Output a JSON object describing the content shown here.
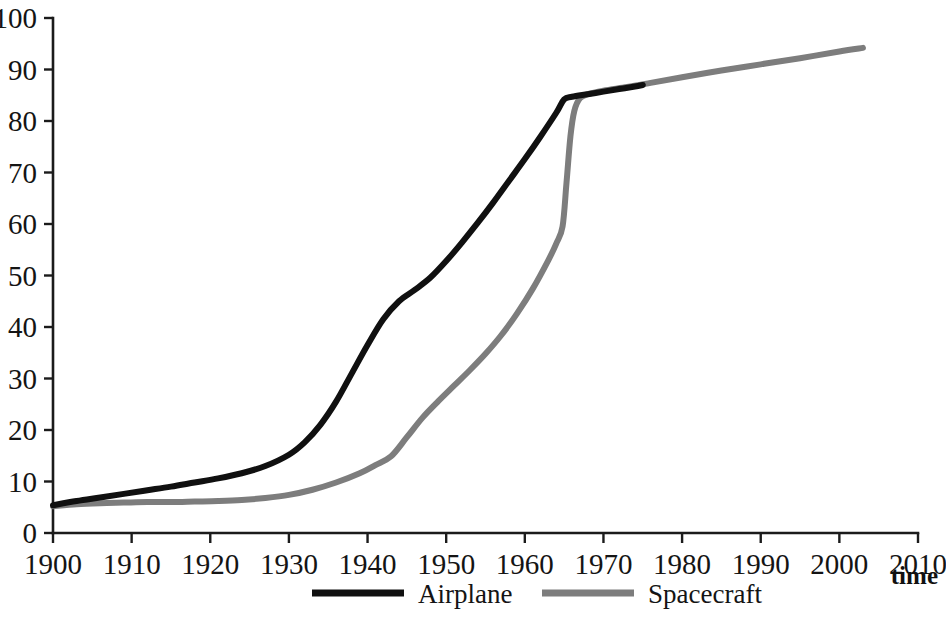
{
  "chart_data": {
    "type": "line",
    "title": "",
    "subtitle": "",
    "xlabel": "time",
    "ylabel": "",
    "xlim": [
      1900,
      2010
    ],
    "ylim": [
      0,
      100
    ],
    "grid": false,
    "legend_position": "bottom-center",
    "x_ticks": [
      1900,
      1910,
      1920,
      1930,
      1940,
      1950,
      1960,
      1970,
      1980,
      1990,
      2000,
      2010
    ],
    "y_ticks": [
      0,
      10,
      20,
      30,
      40,
      50,
      60,
      70,
      80,
      90,
      100
    ],
    "series": [
      {
        "name": "Airplane",
        "color": "#101010",
        "stroke_width": 6,
        "x": [
          1900,
          1903,
          1906,
          1909,
          1912,
          1915,
          1918,
          1921,
          1924,
          1927,
          1930,
          1932,
          1934,
          1936,
          1938,
          1940,
          1942,
          1944,
          1946,
          1948,
          1950,
          1952,
          1954,
          1956,
          1958,
          1960,
          1962,
          1964,
          1965,
          1966,
          1968,
          1970,
          1972,
          1974,
          1975
        ],
        "values": [
          5.4,
          6.2,
          6.9,
          7.6,
          8.3,
          9.0,
          9.8,
          10.6,
          11.6,
          13.0,
          15.2,
          17.6,
          21.0,
          25.5,
          31.0,
          36.5,
          41.5,
          45.0,
          47.2,
          49.6,
          52.8,
          56.4,
          60.2,
          64.2,
          68.4,
          72.6,
          77.0,
          81.6,
          84.2,
          84.7,
          85.2,
          85.7,
          86.2,
          86.7,
          87.0
        ]
      },
      {
        "name": "Spacecraft",
        "color": "#7d7d7d",
        "stroke_width": 6,
        "x": [
          1900,
          1903,
          1906,
          1909,
          1912,
          1915,
          1918,
          1921,
          1924,
          1927,
          1930,
          1933,
          1936,
          1939,
          1941,
          1943,
          1945,
          1947,
          1949,
          1951,
          1953,
          1955,
          1957,
          1959,
          1961,
          1963,
          1964,
          1964.8,
          1965.3,
          1965.8,
          1966.3,
          1967,
          1968,
          1970,
          1973,
          1976,
          1980,
          1985,
          1990,
          1995,
          2000,
          2003
        ],
        "values": [
          5.2,
          5.6,
          5.8,
          5.9,
          6.0,
          6.0,
          6.1,
          6.2,
          6.4,
          6.8,
          7.4,
          8.4,
          9.8,
          11.6,
          13.2,
          14.9,
          18.6,
          22.4,
          25.6,
          28.6,
          31.6,
          34.8,
          38.4,
          42.6,
          47.4,
          53.0,
          56.2,
          59.5,
          68.0,
          77.0,
          82.0,
          84.4,
          85.2,
          85.9,
          86.6,
          87.4,
          88.5,
          89.8,
          91.0,
          92.2,
          93.5,
          94.2
        ]
      }
    ]
  },
  "legend": {
    "items": [
      {
        "label": "Airplane",
        "color": "#101010"
      },
      {
        "label": "Spacecraft",
        "color": "#7d7d7d"
      }
    ]
  },
  "axis": {
    "x_title": "time",
    "y_tick_labels": [
      "0",
      "10",
      "20",
      "30",
      "40",
      "50",
      "60",
      "70",
      "80",
      "90",
      "100"
    ],
    "x_tick_labels": [
      "1900",
      "1910",
      "1920",
      "1930",
      "1940",
      "1950",
      "1960",
      "1970",
      "1980",
      "1990",
      "2000",
      "2010"
    ]
  }
}
